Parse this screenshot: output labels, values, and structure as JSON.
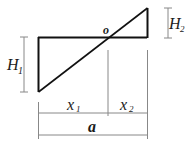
{
  "diagram": {
    "labels": {
      "o": "o",
      "H1": "H",
      "H1_sub": "1",
      "H2": "H",
      "H2_sub": "2",
      "x1": "x",
      "x1_sub": "1",
      "x2": "x",
      "x2_sub": "2",
      "a": "a"
    },
    "colors": {
      "shape": "#111111",
      "dimension": "#888888"
    }
  }
}
